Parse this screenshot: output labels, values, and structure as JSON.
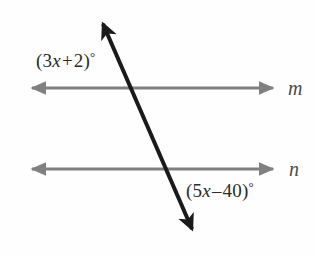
{
  "figure": {
    "kind": "geometry-diagram",
    "background_color": "#fefefe",
    "parallel_line_color": "#808080",
    "transversal_color": "#1a1a1a",
    "label_color": "#2b2b2b",
    "line_name_color": "#4a4a4a"
  },
  "lines": {
    "upper_parallel": {
      "name": "m",
      "y": 88,
      "x_start": 28,
      "x_end": 277,
      "stroke_width": 3,
      "arrowheads": "both"
    },
    "lower_parallel": {
      "name": "n",
      "y": 169,
      "x_start": 28,
      "x_end": 277,
      "stroke_width": 3,
      "arrowheads": "both"
    },
    "transversal": {
      "x_top": 99,
      "y_top": 15,
      "x_bottom": 196,
      "y_bottom": 238,
      "stroke_width": 4,
      "arrowheads": "both",
      "intersection_with_m_x": 133,
      "intersection_with_n_x": 170
    }
  },
  "angles": {
    "upper": {
      "coefficient": "3",
      "variable": "x",
      "operator": "+",
      "constant": "2",
      "open_paren": "(",
      "close_paren": ")",
      "degree": "°",
      "full_text": "(3x + 2)°",
      "position": "above line m, left of transversal"
    },
    "lower": {
      "coefficient": "5",
      "variable": "x",
      "operator": "–",
      "constant": "40",
      "open_paren": "(",
      "close_paren": ")",
      "degree": "°",
      "full_text": "(5x – 40)°",
      "position": "below line n, right of transversal"
    }
  },
  "line_labels": {
    "m": "m",
    "n": "n"
  }
}
